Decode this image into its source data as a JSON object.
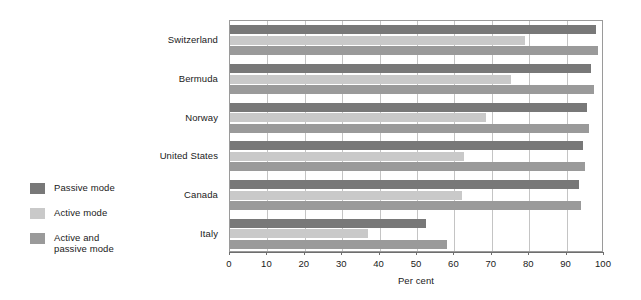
{
  "chart_data": {
    "type": "bar",
    "orientation": "horizontal",
    "title": "",
    "xlabel": "Per cent",
    "ylabel": "",
    "xlim": [
      0,
      100
    ],
    "xticks": [
      "0",
      "10",
      "20",
      "30",
      "40",
      "50",
      "60",
      "70",
      "80",
      "90",
      "100"
    ],
    "grid": "vertical",
    "legend_position": "left-outside",
    "categories": [
      "Switzerland",
      "Bermuda",
      "Norway",
      "United States",
      "Canada",
      "Italy"
    ],
    "series": [
      {
        "name": "Passive mode",
        "color": "#787878",
        "values": [
          97.8,
          96.5,
          95.5,
          94.5,
          93.2,
          52.3
        ]
      },
      {
        "name": "Active mode",
        "color": "#c9c9c9",
        "values": [
          79.0,
          75.0,
          68.5,
          62.5,
          62.0,
          37.0
        ]
      },
      {
        "name": "Active and\npassive mode",
        "color": "#9a9a9a",
        "values": [
          98.3,
          97.3,
          96.0,
          94.8,
          93.8,
          58.0
        ]
      }
    ]
  },
  "legend": {
    "items": [
      {
        "label": "Passive mode",
        "color": "#787878"
      },
      {
        "label": "Active mode",
        "color": "#c9c9c9"
      },
      {
        "label": "Active and\npassive mode",
        "color": "#9a9a9a"
      }
    ]
  },
  "axis": {
    "x_title": "Per cent"
  }
}
